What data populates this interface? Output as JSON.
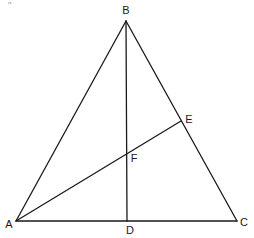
{
  "diagram": {
    "type": "geometry-triangle",
    "stroke_color": "#1a1a1a",
    "background": "#ffffff",
    "points": {
      "A": {
        "label": "A",
        "x": 16,
        "y": 221,
        "label_x": 9,
        "label_y": 224
      },
      "B": {
        "label": "B",
        "x": 126,
        "y": 21,
        "label_x": 126,
        "label_y": 10
      },
      "C": {
        "label": "C",
        "x": 237,
        "y": 221,
        "label_x": 244,
        "label_y": 222
      },
      "D": {
        "label": "D",
        "x": 127,
        "y": 221,
        "label_x": 130,
        "label_y": 230
      },
      "E": {
        "label": "E",
        "x": 181,
        "y": 121,
        "label_x": 189,
        "label_y": 119
      },
      "F": {
        "label": "F",
        "x": 127,
        "y": 153,
        "label_x": 134,
        "label_y": 158
      }
    },
    "segments": [
      {
        "name": "AB",
        "from": "A",
        "to": "B"
      },
      {
        "name": "BC",
        "from": "B",
        "to": "C"
      },
      {
        "name": "AC",
        "from": "A",
        "to": "C"
      },
      {
        "name": "BD",
        "from": "B",
        "to": "D"
      },
      {
        "name": "AE",
        "from": "A",
        "to": "E"
      }
    ],
    "stray_mark": "g"
  }
}
